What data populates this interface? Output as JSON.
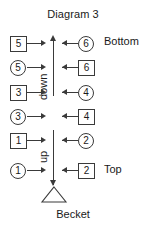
{
  "title": "Diagram 3",
  "caption": "Becket",
  "labels": {
    "bottom": "Bottom",
    "top": "Top",
    "direction_upper": "down",
    "direction_lower": "up"
  },
  "colors": {
    "stroke": "#3a3a3a",
    "text": "#1a1a1a",
    "background": "#ffffff"
  },
  "rows": [
    {
      "left_shape": "square",
      "left_value": "5",
      "right_shape": "circle",
      "right_value": "6",
      "side_label": "Bottom"
    },
    {
      "left_shape": "circle",
      "left_value": "5",
      "right_shape": "square",
      "right_value": "6",
      "side_label": ""
    },
    {
      "left_shape": "square",
      "left_value": "3",
      "right_shape": "circle",
      "right_value": "4",
      "side_label": ""
    },
    {
      "left_shape": "circle",
      "left_value": "3",
      "right_shape": "square",
      "right_value": "4",
      "side_label": ""
    },
    {
      "left_shape": "square",
      "left_value": "1",
      "right_shape": "circle",
      "right_value": "2",
      "side_label": ""
    },
    {
      "left_shape": "circle",
      "left_value": "1",
      "right_shape": "square",
      "right_value": "2",
      "side_label": "Top"
    }
  ],
  "icons": {
    "arrow_right": "arrow-right-icon",
    "arrow_left": "arrow-left-icon",
    "arrow_up": "arrow-up-icon",
    "arrow_down": "arrow-down-icon",
    "becket": "triangle-becket-icon"
  }
}
